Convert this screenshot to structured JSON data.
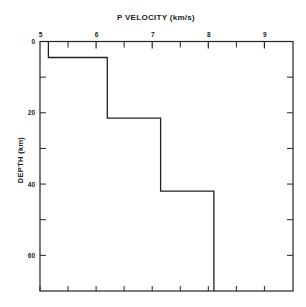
{
  "chart_data": {
    "type": "line",
    "subtype": "step-profile",
    "title": "P VELOCITY (km/s)",
    "xlabel": "P VELOCITY (km/s)",
    "ylabel": "DEPTH (km)",
    "x_axis_position": "top",
    "y_axis_inverted": true,
    "xlim": [
      5,
      9.5
    ],
    "ylim": [
      0,
      70
    ],
    "x_ticks": [
      5,
      6,
      7,
      8,
      9
    ],
    "x_tick_labels": [
      "5",
      "6",
      "7",
      "8",
      "9"
    ],
    "x_minor_ticks": [
      5.5,
      6.5,
      7.5,
      8.5
    ],
    "y_ticks": [
      0,
      20,
      40,
      60
    ],
    "y_tick_labels": [
      "0",
      "20",
      "40",
      "60"
    ],
    "y_minor_ticks": [
      10,
      30,
      50
    ],
    "grid": false,
    "legend": null,
    "series": [
      {
        "name": "P-wave velocity profile",
        "points": [
          {
            "velocity": 5.15,
            "depth": 0
          },
          {
            "velocity": 5.15,
            "depth": 4.5
          },
          {
            "velocity": 6.2,
            "depth": 4.5
          },
          {
            "velocity": 6.2,
            "depth": 21.5
          },
          {
            "velocity": 7.15,
            "depth": 21.5
          },
          {
            "velocity": 7.15,
            "depth": 42
          },
          {
            "velocity": 8.1,
            "depth": 42
          },
          {
            "velocity": 8.1,
            "depth": 70
          }
        ],
        "layers": [
          {
            "top_km": 0,
            "bottom_km": 4.5,
            "velocity_kms": 5.15
          },
          {
            "top_km": 4.5,
            "bottom_km": 21.5,
            "velocity_kms": 6.2
          },
          {
            "top_km": 21.5,
            "bottom_km": 42,
            "velocity_kms": 7.15
          },
          {
            "top_km": 42,
            "bottom_km": 70,
            "velocity_kms": 8.1
          }
        ]
      }
    ]
  },
  "colors": {
    "line": "#222222",
    "axis": "#222222",
    "background": "#ffffff"
  }
}
